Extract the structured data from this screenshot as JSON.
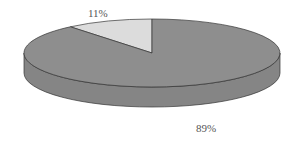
{
  "chart_data": {
    "type": "pie",
    "style": "3d",
    "title": "",
    "slices": [
      {
        "label": "89%",
        "value": 89,
        "color": "#8e8e8e"
      },
      {
        "label": "11%",
        "value": 11,
        "color": "#dcdcdc"
      }
    ],
    "legend": "none"
  }
}
